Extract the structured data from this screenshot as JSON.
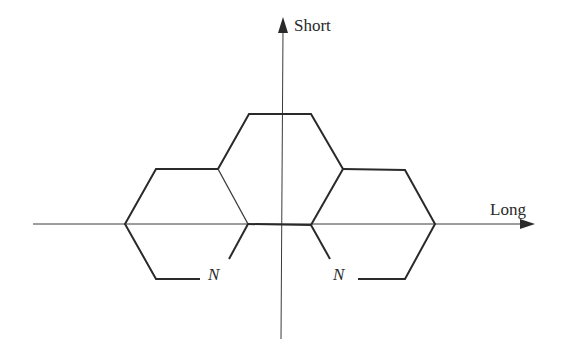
{
  "diagram": {
    "axes": {
      "vertical": {
        "label": "Short",
        "direction": "up"
      },
      "horizontal": {
        "label": "Long",
        "direction": "right"
      }
    },
    "atoms": [
      {
        "symbol": "N",
        "position": "left"
      },
      {
        "symbol": "N",
        "position": "right"
      }
    ],
    "rings": [
      {
        "name": "left-ring",
        "type": "pyridine",
        "contains": "N"
      },
      {
        "name": "center-ring",
        "type": "benzene"
      },
      {
        "name": "right-ring",
        "type": "pyridine",
        "contains": "N"
      }
    ],
    "colors": {
      "line": "#2a2a2a",
      "background": "#ffffff"
    }
  }
}
